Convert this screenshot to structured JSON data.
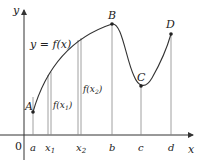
{
  "diagram": {
    "axes": {
      "x_label": "x",
      "y_label": "y",
      "origin_label": "0"
    },
    "curve_label": "y = f(x)",
    "points": [
      {
        "name": "A",
        "x": 33,
        "y": 112
      },
      {
        "name": "B",
        "x": 112,
        "y": 24
      },
      {
        "name": "C",
        "x": 141,
        "y": 86
      },
      {
        "name": "D",
        "x": 171,
        "y": 34
      }
    ],
    "x_ticks": [
      {
        "label": "a",
        "x": 33
      },
      {
        "label": "x1",
        "x": 50
      },
      {
        "label": "x2",
        "x": 80
      },
      {
        "label": "b",
        "x": 112
      },
      {
        "label": "c",
        "x": 141
      },
      {
        "label": "d",
        "x": 171
      }
    ],
    "value_labels": {
      "f_x1": "f(x1)",
      "f_x2": "f(x2)"
    },
    "colors": {
      "curve": "#333333",
      "axes": "#333333",
      "verticals": "#888888",
      "points": "#222222"
    }
  }
}
